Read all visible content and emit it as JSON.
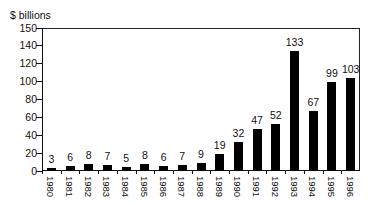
{
  "chart_data": {
    "type": "bar",
    "title": "",
    "ylabel": "$ billions",
    "xlabel": "",
    "categories": [
      "1980",
      "1981",
      "1982",
      "1983",
      "1984",
      "1985",
      "1986",
      "1987",
      "1988",
      "1989",
      "1990",
      "1991",
      "1992",
      "1993",
      "1994",
      "1995",
      "1996"
    ],
    "values": [
      3,
      6,
      8,
      7,
      5,
      8,
      6,
      7,
      9,
      19,
      32,
      47,
      52,
      133,
      67,
      99,
      103
    ],
    "yticks": [
      0,
      20,
      40,
      60,
      80,
      100,
      120,
      140,
      150
    ],
    "ylim": [
      0,
      150
    ],
    "grid": false,
    "legend": null,
    "bar_color": "#000000",
    "x_label_orientation": "vertical"
  },
  "labels": {
    "unit": "$ billions"
  }
}
